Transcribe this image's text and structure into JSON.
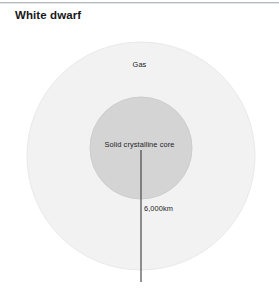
{
  "title": "White dwarf",
  "diagram": {
    "type": "cross-section-diagram",
    "layers": [
      {
        "id": "gas",
        "label": "Gas",
        "shape": "circle",
        "fill": "#f2f2f2",
        "stroke": "#e6e6e6",
        "center": [
          141,
          156
        ],
        "radius": 114
      },
      {
        "id": "core",
        "label": "Solid crystalline core",
        "shape": "circle",
        "fill": "#d4d4d4",
        "stroke": "#cccccc",
        "center": [
          141,
          148
        ],
        "radius": 51
      }
    ],
    "measurement": {
      "label": "6,000km",
      "line_color": "#3a3a3a",
      "from": [
        141,
        150
      ],
      "to": [
        141,
        282
      ],
      "describes": "radius of the white dwarf"
    }
  },
  "colors": {
    "background": "#ffffff",
    "title_text": "#17181a",
    "label_text": "#1b1c1e",
    "outer_circle": "#f2f2f2",
    "inner_circle": "#d4d4d4",
    "top_rule": "#b9bcbe"
  }
}
